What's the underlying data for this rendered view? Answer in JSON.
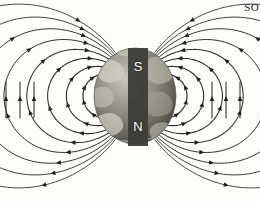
{
  "figure": {
    "background_color": "#fdfdfb",
    "line_color": "#2b2b2b",
    "corner_text": "SO"
  },
  "earth": {
    "name": "earth-globe",
    "center_x": 135,
    "center_y": 96,
    "radius_x": 41,
    "radius_y": 48,
    "tint_dark": "#4a4a48",
    "tint_light": "#b9b7b0"
  },
  "magnet": {
    "name": "bar-magnet",
    "x": 128,
    "y": 48,
    "width": 20,
    "height": 98,
    "color": "#3a3a38",
    "south_label": "S",
    "north_label": "N"
  },
  "chart_data": {
    "type": "line",
    "xlabel": "",
    "ylabel": "",
    "grid": false,
    "legend": "none",
    "xlim": [
      0,
      260
    ],
    "ylim": [
      0,
      203
    ],
    "dipole_center": [
      135,
      96
    ],
    "loop_scales": [
      1.0,
      1.32,
      1.68,
      2.08,
      2.52,
      3.0,
      3.52,
      4.1
    ],
    "loop_count": 8,
    "arrow_count_per_loop": 4,
    "series": [
      {
        "name": "loop-1",
        "scale": 1.0
      },
      {
        "name": "loop-2",
        "scale": 1.32
      },
      {
        "name": "loop-3",
        "scale": 1.68
      },
      {
        "name": "loop-4",
        "scale": 2.08
      },
      {
        "name": "loop-5",
        "scale": 2.52
      },
      {
        "name": "loop-6",
        "scale": 3.0
      },
      {
        "name": "loop-7",
        "scale": 3.52
      },
      {
        "name": "loop-8",
        "scale": 4.1
      }
    ]
  }
}
